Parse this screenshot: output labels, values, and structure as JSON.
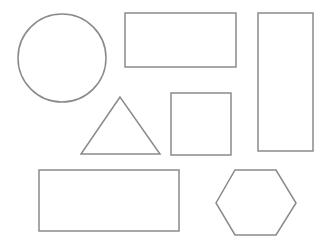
{
  "canvas": {
    "width": 331,
    "height": 237,
    "background": "#ffffff",
    "stroke": "#8a8a8a"
  },
  "shapes": {
    "circle": {
      "cx": 62,
      "cy": 58,
      "r": 44
    },
    "rect_top": {
      "x": 125,
      "y": 13,
      "width": 111,
      "height": 54
    },
    "rect_tall": {
      "x": 258,
      "y": 13,
      "width": 55,
      "height": 138
    },
    "triangle": {
      "points": "120,97 81,154 160,154"
    },
    "square": {
      "x": 171,
      "y": 93,
      "width": 60,
      "height": 62
    },
    "rect_bottom": {
      "x": 39,
      "y": 170,
      "width": 140,
      "height": 61
    },
    "hexagon": {
      "points": "235,170 276,170 296,203 276,235 235,235 216,203"
    }
  }
}
